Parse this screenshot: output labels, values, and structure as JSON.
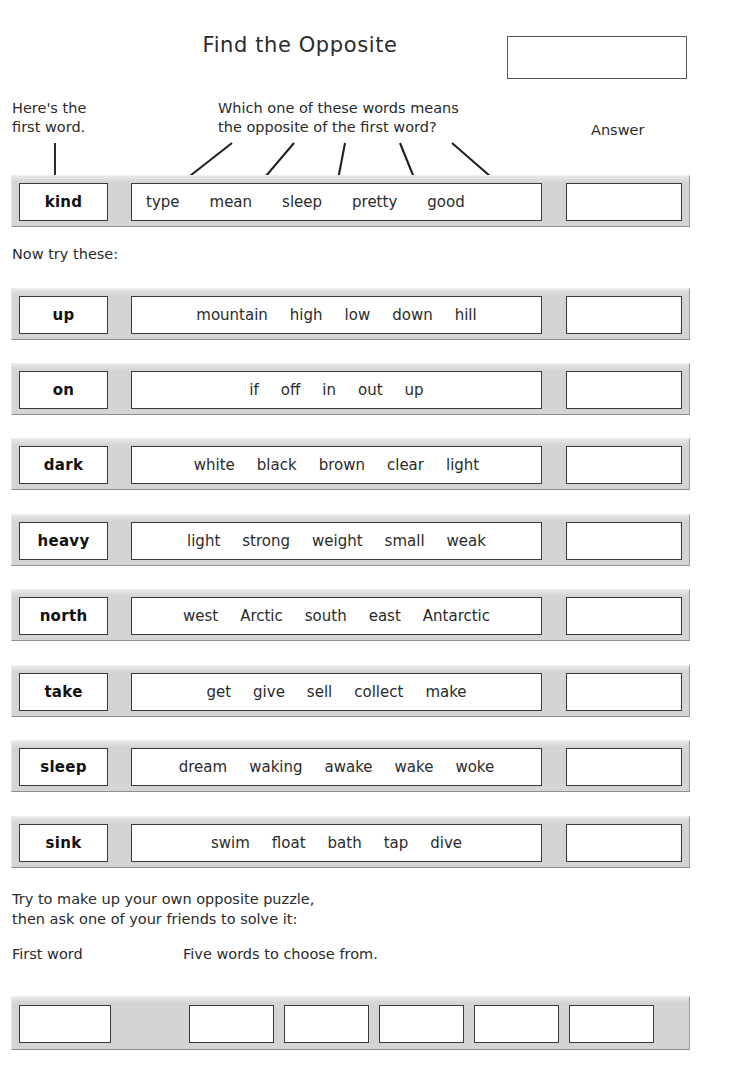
{
  "header": {
    "title": "Find the Opposite",
    "name_box_value": ""
  },
  "annotations": {
    "first_word_label": "Here's the\nfirst word.",
    "which_label": "Which one of these words means\nthe opposite of the first word?",
    "answer_label": "Answer"
  },
  "example_row": {
    "first_word": "kind",
    "choices": [
      "type",
      "mean",
      "sleep",
      "pretty",
      "good"
    ],
    "answer": ""
  },
  "now_try_label": "Now try these:",
  "rows": [
    {
      "first_word": "up",
      "choices": [
        "mountain",
        "high",
        "low",
        "down",
        "hill"
      ],
      "answer": ""
    },
    {
      "first_word": "on",
      "choices": [
        "if",
        "off",
        "in",
        "out",
        "up"
      ],
      "answer": ""
    },
    {
      "first_word": "dark",
      "choices": [
        "white",
        "black",
        "brown",
        "clear",
        "light"
      ],
      "answer": ""
    },
    {
      "first_word": "heavy",
      "choices": [
        "light",
        "strong",
        "weight",
        "small",
        "weak"
      ],
      "answer": ""
    },
    {
      "first_word": "north",
      "choices": [
        "west",
        "Arctic",
        "south",
        "east",
        "Antarctic"
      ],
      "answer": ""
    },
    {
      "first_word": "take",
      "choices": [
        "get",
        "give",
        "sell",
        "collect",
        "make"
      ],
      "answer": ""
    },
    {
      "first_word": "sleep",
      "choices": [
        "dream",
        "waking",
        "awake",
        "wake",
        "woke"
      ],
      "answer": ""
    },
    {
      "first_word": "sink",
      "choices": [
        "swim",
        "float",
        "bath",
        "tap",
        "dive"
      ],
      "answer": ""
    }
  ],
  "footer": {
    "instruction": "Try to make up your own opposite puzzle,\nthen ask one of your friends to solve it:",
    "first_word_label": "First word",
    "five_words_label": "Five words to choose from.",
    "blank_first_word": "",
    "blank_choices": [
      "",
      "",
      "",
      "",
      ""
    ]
  },
  "colors": {
    "band": "#d4d4d4",
    "box_border": "#3a3a3a",
    "text": "#2b2b2b",
    "page_background": "#ffffff"
  }
}
